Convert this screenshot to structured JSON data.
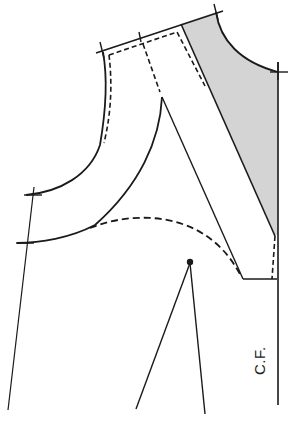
{
  "figure": {
    "type": "sewing-pattern-bodice-front",
    "labels": {
      "center_front": "C.F."
    },
    "colors": {
      "line": "#1a1a1a",
      "shading": "#d4d4d4",
      "background": "#ffffff"
    },
    "elements": [
      "shoulder-line",
      "neckline-curve",
      "armhole-curve",
      "inner-curve",
      "dashed-seam-outline",
      "dashed-style-line",
      "shaded-panel",
      "center-front-line",
      "dart-point",
      "dart-legs",
      "side-seam-line",
      "crossmark-notches"
    ]
  }
}
